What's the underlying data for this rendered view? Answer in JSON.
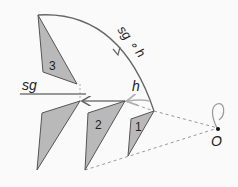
{
  "labels": {
    "sg": "sg",
    "h": "h",
    "composition": "sg ∘ h",
    "origin": "O",
    "tri1": "1",
    "tri2": "2",
    "tri3": "3"
  },
  "colors": {
    "fill": "#b9b9b9",
    "stroke": "#555555",
    "arrow": "#777777",
    "light_arrow": "#b0b0b0",
    "dashed": "#999999"
  }
}
